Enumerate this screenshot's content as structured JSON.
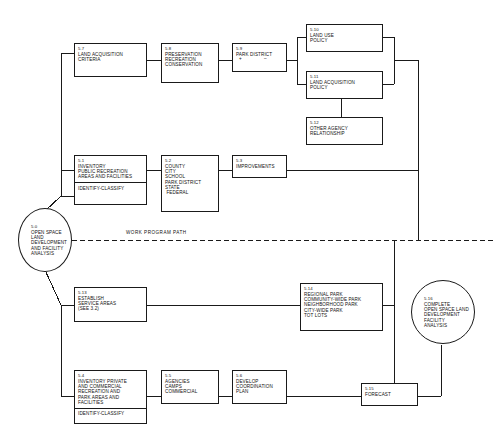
{
  "diagram": {
    "title": "Open Space Land Development and Facility Analysis",
    "type": "flowchart",
    "line_color": "#1a1a1a",
    "background": "#ffffff"
  },
  "path_label": "WORK PROGRAM PATH",
  "nodes": {
    "n50": {
      "number": "5.0",
      "lines": [
        "OPEN SPACE",
        "LAND",
        "DEVELOPMENT",
        "AND FACILITY",
        "ANALYSIS"
      ],
      "shape": "circle"
    },
    "n51": {
      "number": "5.1",
      "lines": [
        "INVENTORY",
        "PUBLIC RECREATION",
        "AREAS AND FACILITIES"
      ],
      "sub": "IDENTIFY-CLASSIFY",
      "shape": "box"
    },
    "n52": {
      "number": "5.2",
      "lines": [
        "COUNTY",
        "CITY",
        "SCHOOL",
        "PARK DISTRICT",
        "STATE",
        " FEDERAL"
      ],
      "shape": "box"
    },
    "n53": {
      "number": "5.3",
      "lines": [
        "IMPROVEMENTS"
      ],
      "shape": "box"
    },
    "n54": {
      "number": "5.4",
      "lines": [
        "INVENTORY PRIVATE",
        "AND COMMERCIAL",
        "RECREATION AND",
        "PARK AREAS AND",
        "FACILITIES"
      ],
      "sub": "IDENTIFY-CLASSIFY",
      "shape": "box"
    },
    "n55": {
      "number": "5.5",
      "lines": [
        "AGENCIES",
        "CAMPS",
        "COMMERCIAL"
      ],
      "shape": "box"
    },
    "n56": {
      "number": "5.6",
      "lines": [
        "DEVELOP",
        "COORDINATION",
        "PLAN"
      ],
      "shape": "box"
    },
    "n57": {
      "number": "5.7",
      "lines": [
        "LAND ACQUISITION",
        "CRITERIA"
      ],
      "shape": "box"
    },
    "n58": {
      "number": "5.8",
      "lines": [
        "PRESERVATION",
        "RECREATION",
        "CONSERVATION"
      ],
      "shape": "box"
    },
    "n59": {
      "number": "5.9",
      "lines": [
        "PARK DISTRICT"
      ],
      "plus": "+",
      "minus": "–",
      "shape": "box"
    },
    "n510": {
      "number": "5.10",
      "lines": [
        "LAND USE",
        "POLICY"
      ],
      "shape": "box"
    },
    "n511": {
      "number": "5.11",
      "lines": [
        "LAND ACQUISITION",
        "POLICY"
      ],
      "shape": "box"
    },
    "n512": {
      "number": "5.12",
      "lines": [
        "OTHER AGENCY",
        "RELATIONSHIP"
      ],
      "shape": "box"
    },
    "n513": {
      "number": "5.13",
      "lines": [
        "ESTABLISH",
        "SERVICE AREAS",
        "(SEE 3.2)"
      ],
      "shape": "box"
    },
    "n514": {
      "number": "5.14",
      "lines": [
        "REGIONAL PARK",
        "COMMUNITY-WIDE PARK",
        "NEIGHBORHOOD PARK",
        "CITY-WIDE PARK",
        "TOT LOTS"
      ],
      "shape": "box"
    },
    "n515": {
      "number": "5.15",
      "lines": [
        "FORECAST"
      ],
      "shape": "box"
    },
    "n516": {
      "number": "5.16",
      "lines": [
        "COMPLETE",
        "OPEN SPACE LAND",
        "DEVELOPMENT",
        "FACILITY",
        "ANALYSIS"
      ],
      "shape": "circle"
    }
  }
}
